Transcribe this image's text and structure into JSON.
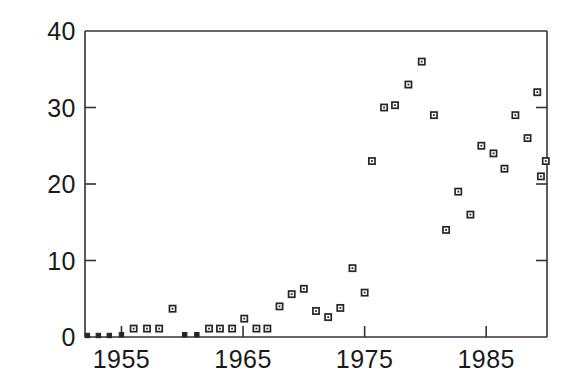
{
  "chart_data": {
    "type": "scatter",
    "title": "",
    "xlabel": "",
    "ylabel": "",
    "xlim": [
      1952.0,
      1990.0
    ],
    "ylim": [
      0,
      40
    ],
    "xticks": [
      1955,
      1965,
      1975,
      1985
    ],
    "xticklabels": [
      "1955",
      "1965",
      "1975",
      "1985"
    ],
    "yticks": [
      0,
      10,
      20,
      30,
      40
    ],
    "yticklabels": [
      "0",
      "10",
      "20",
      "30",
      "40"
    ],
    "grid": false,
    "legend": null,
    "marker": "open-square",
    "marker_color": "#262626",
    "series": [
      {
        "name": "values",
        "x": [
          1952,
          1953,
          1954,
          1955,
          1956,
          1957,
          1958,
          1959,
          1960,
          1961,
          1962,
          1963,
          1964,
          1965,
          1966,
          1967,
          1968,
          1969,
          1970,
          1971,
          1972,
          1973,
          1974,
          1975,
          1976,
          1977,
          1978,
          1979,
          1980,
          1981,
          1982,
          1983,
          1984,
          1985,
          1986,
          1987,
          1988,
          1989
        ],
        "y": [
          0,
          0,
          0,
          0,
          0,
          0,
          1,
          1,
          1,
          3.7,
          0,
          0,
          1,
          1,
          1,
          2.3,
          1,
          4,
          5.5,
          6.3,
          3.3,
          2.5,
          3.7,
          9,
          5.7,
          23,
          30,
          30.3,
          33,
          36,
          29,
          14,
          19,
          16,
          25,
          24,
          22,
          29
        ],
        "values_note": "y-values read from axis scale"
      }
    ],
    "points": [
      {
        "x": 1952.2,
        "y": 0.2
      },
      {
        "x": 1953.1,
        "y": 0.2
      },
      {
        "x": 1954.0,
        "y": 0.2
      },
      {
        "x": 1955.0,
        "y": 0.3
      },
      {
        "x": 1956.0,
        "y": 1.1
      },
      {
        "x": 1957.1,
        "y": 1.1
      },
      {
        "x": 1958.1,
        "y": 1.1
      },
      {
        "x": 1959.2,
        "y": 3.7
      },
      {
        "x": 1960.2,
        "y": 0.3
      },
      {
        "x": 1961.2,
        "y": 0.3
      },
      {
        "x": 1962.2,
        "y": 1.1
      },
      {
        "x": 1963.1,
        "y": 1.1
      },
      {
        "x": 1964.1,
        "y": 1.1
      },
      {
        "x": 1965.1,
        "y": 2.4
      },
      {
        "x": 1966.1,
        "y": 1.1
      },
      {
        "x": 1967.0,
        "y": 1.1
      },
      {
        "x": 1968.0,
        "y": 4.0
      },
      {
        "x": 1969.0,
        "y": 5.6
      },
      {
        "x": 1970.0,
        "y": 6.3
      },
      {
        "x": 1971.0,
        "y": 3.4
      },
      {
        "x": 1972.0,
        "y": 2.6
      },
      {
        "x": 1973.0,
        "y": 3.8
      },
      {
        "x": 1974.0,
        "y": 9.0
      },
      {
        "x": 1975.0,
        "y": 5.8
      },
      {
        "x": 1975.6,
        "y": 23.0
      },
      {
        "x": 1976.6,
        "y": 30.0
      },
      {
        "x": 1977.5,
        "y": 30.3
      },
      {
        "x": 1978.6,
        "y": 33.0
      },
      {
        "x": 1979.7,
        "y": 36.0
      },
      {
        "x": 1980.7,
        "y": 29.0
      },
      {
        "x": 1981.7,
        "y": 14.0
      },
      {
        "x": 1982.7,
        "y": 19.0
      },
      {
        "x": 1983.7,
        "y": 16.0
      },
      {
        "x": 1984.6,
        "y": 25.0
      },
      {
        "x": 1985.6,
        "y": 24.0
      },
      {
        "x": 1986.5,
        "y": 22.0
      },
      {
        "x": 1987.4,
        "y": 29.0
      },
      {
        "x": 1988.4,
        "y": 26.0
      },
      {
        "x": 1989.2,
        "y": 32.0
      },
      {
        "x": 1989.5,
        "y": 21.0
      },
      {
        "x": 1989.9,
        "y": 23.0
      }
    ],
    "axis_style": {
      "frame": "box",
      "tick_direction": "in",
      "axis_color": "#333333"
    }
  },
  "geometry": {
    "plot_left": 85,
    "plot_right": 547,
    "plot_top": 31,
    "plot_bottom": 337
  }
}
